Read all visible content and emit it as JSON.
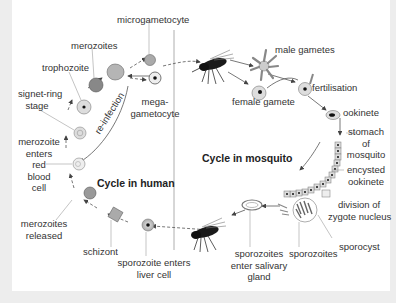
{
  "diagram": {
    "type": "life-cycle",
    "titles": {
      "human": "Cycle in human",
      "mosquito": "Cycle in mosquito"
    },
    "labels": {
      "microgametocyte": "microgametocyte",
      "merozoites": "merozoites",
      "trophozoite": "trophozoite",
      "signet_ring_1": "signet-ring",
      "signet_ring_2": "stage",
      "mega_1": "mega-",
      "mega_2": "gametocyte",
      "reinfection": "re-infection",
      "merozoite_enters_1": "merozoite",
      "merozoite_enters_2": "enters",
      "merozoite_enters_3": "red",
      "merozoite_enters_4": "blood",
      "merozoite_enters_5": "cell",
      "merozoites_released_1": "merozoites",
      "merozoites_released_2": "released",
      "schizont": "schizont",
      "sporozoite_enters_1": "sporozoite enters",
      "sporozoite_enters_2": "liver cell",
      "male_gametes": "male gametes",
      "female_gamete": "female gamete",
      "fertilisation": "fertilisation",
      "ookinete": "ookinete",
      "stomach_1": "stomach",
      "stomach_2": "of",
      "stomach_3": "mosquito",
      "encysted_1": "encysted",
      "encysted_2": "ookinete",
      "division_1": "division of",
      "division_2": "zygote nucleus",
      "sporocyst": "sporocyst",
      "sporozoites": "sporozoites",
      "salivary_1": "sporozoites",
      "salivary_2": "enter salivary",
      "salivary_3": "gland"
    },
    "nodes_human_cycle": [
      "sporozoite enters liver cell",
      "schizont",
      "merozoites released",
      "merozoite enters red blood cell",
      "signet-ring stage",
      "trophozoite",
      "merozoites",
      "microgametocyte",
      "mega-gametocyte"
    ],
    "nodes_mosquito_cycle": [
      "male gametes",
      "female gamete",
      "fertilisation",
      "ookinete",
      "stomach of mosquito",
      "encysted ookinete",
      "division of zygote nucleus",
      "sporocyst",
      "sporozoites",
      "sporozoites enter salivary gland"
    ],
    "colors": {
      "background": "#ffffff",
      "frame": "#ededed",
      "line": "#555555",
      "cell_fill": "#cfcfcf",
      "mosquito": "#1a1a1a"
    }
  }
}
